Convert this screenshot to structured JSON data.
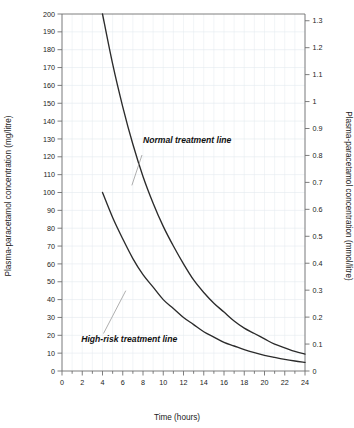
{
  "chart_data": {
    "type": "line",
    "title": "",
    "xlabel": "Time (hours)",
    "ylabel": "Plasma-paracetamol concentration (mg/litre)",
    "ylabel_right": "Plasma-paracetamol concentration (mmol/litre)",
    "xlim": [
      0,
      24
    ],
    "ylim": [
      0,
      200
    ],
    "ylim_right": [
      0,
      1.325
    ],
    "grid": true,
    "grid_minor_x_step": 1,
    "grid_major_x_step": 2,
    "grid_major_y_step": 10,
    "legend": "none",
    "xticks": [
      0,
      2,
      4,
      6,
      8,
      10,
      12,
      14,
      16,
      18,
      20,
      22,
      24
    ],
    "xtick_labels": [
      "0",
      "2",
      "4",
      "6",
      "8",
      "10",
      "12",
      "14",
      "16",
      "18",
      "20",
      "22",
      "24"
    ],
    "yticks": [
      0,
      10,
      20,
      30,
      40,
      50,
      60,
      70,
      80,
      90,
      100,
      110,
      120,
      130,
      140,
      150,
      160,
      170,
      180,
      190,
      200
    ],
    "ytick_labels": [
      "0",
      "10",
      "20",
      "30",
      "40",
      "50",
      "60",
      "70",
      "80",
      "90",
      "100",
      "110",
      "120",
      "130",
      "140",
      "150",
      "160",
      "170",
      "180",
      "190",
      "200"
    ],
    "yticks_right": [
      0,
      0.1,
      0.2,
      0.3,
      0.4,
      0.5,
      0.6,
      0.7,
      0.8,
      0.9,
      1,
      1.1,
      1.2,
      1.3
    ],
    "ytick_labels_right": [
      "0",
      "0.1",
      "0.2",
      "0.3",
      "0.4",
      "0.5",
      "0.6",
      "0.7",
      "0.8",
      "0.9",
      "1",
      "1.1",
      "1.2",
      "1.3"
    ],
    "series": [
      {
        "name": "Normal treatment line",
        "x": [
          4,
          5,
          6,
          7,
          8,
          9,
          10,
          11,
          12,
          13,
          14,
          15,
          16,
          17,
          18,
          19,
          20,
          21,
          22,
          23,
          24
        ],
        "values": [
          200,
          172,
          148,
          127,
          109,
          94,
          81,
          70,
          60,
          51,
          44,
          38,
          33,
          28,
          24,
          21,
          18,
          15,
          13,
          11,
          9.5
        ]
      },
      {
        "name": "High-risk treatment line",
        "x": [
          4,
          5,
          6,
          7,
          8,
          9,
          10,
          11,
          12,
          13,
          14,
          15,
          16,
          17,
          18,
          19,
          20,
          21,
          22,
          23,
          24
        ],
        "values": [
          100,
          86,
          74,
          63,
          54,
          47,
          40,
          35,
          30,
          26,
          22,
          19,
          16,
          14,
          12,
          10.3,
          8.8,
          7.6,
          6.5,
          5.6,
          4.8
        ]
      }
    ],
    "annotations": [
      {
        "text": "Normal treatment line",
        "x_hours": 8.0,
        "y_value": 128
      },
      {
        "text": "High-risk treatment line",
        "x_hours": 1.9,
        "y_value": 16
      }
    ]
  },
  "colors": {
    "curve": "#2b2b2b",
    "axis": "#6f6f6f",
    "grid": "#e9eef2",
    "leader": "#9a9a9a",
    "text": "#222222",
    "background": "#ffffff"
  }
}
